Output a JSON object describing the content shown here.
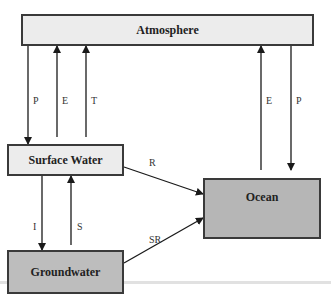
{
  "diagram": {
    "title": "",
    "nodes": {
      "atmosphere": {
        "label": "Atmosphere",
        "fill": "#ececec"
      },
      "surface_water": {
        "label": "Surface Water",
        "fill": "#ececec"
      },
      "groundwater": {
        "label": "Groundwater",
        "fill": "#bdbdbd"
      },
      "ocean": {
        "label": "Ocean",
        "fill": "#b6b6b6"
      }
    },
    "edges": [
      {
        "id": "p-atm-surface",
        "label": "P",
        "from": "Atmosphere",
        "to": "Surface Water"
      },
      {
        "id": "e-surface-atm",
        "label": "E",
        "from": "Surface Water",
        "to": "Atmosphere"
      },
      {
        "id": "t-surface-atm",
        "label": "T",
        "from": "Surface Water",
        "to": "Atmosphere"
      },
      {
        "id": "e-ocean-atm",
        "label": "E",
        "from": "Ocean",
        "to": "Atmosphere"
      },
      {
        "id": "p-atm-ocean",
        "label": "P",
        "from": "Atmosphere",
        "to": "Ocean"
      },
      {
        "id": "r-surface-ocean",
        "label": "R",
        "from": "Surface Water",
        "to": "Ocean"
      },
      {
        "id": "i-surface-ground",
        "label": "I",
        "from": "Surface Water",
        "to": "Groundwater"
      },
      {
        "id": "s-ground-surface",
        "label": "S",
        "from": "Groundwater",
        "to": "Surface Water"
      },
      {
        "id": "sr-ground-ocean",
        "label": "SR",
        "from": "Groundwater",
        "to": "Ocean"
      }
    ]
  }
}
